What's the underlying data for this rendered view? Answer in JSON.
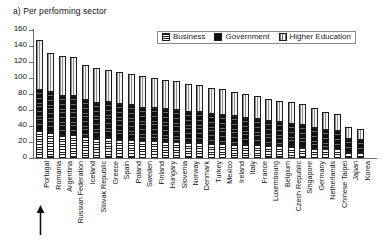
{
  "chart_title": "a) Per performing sector",
  "legend": {
    "position": "top-center",
    "items": [
      {
        "label": "Business",
        "pattern": "horizontal-hatch"
      },
      {
        "label": "Government",
        "pattern": "solid-black"
      },
      {
        "label": "Higher Education",
        "pattern": "vertical-hatch"
      }
    ]
  },
  "annotation": {
    "arrow_icon": "up-arrow",
    "points_at": "Portugal"
  },
  "chart_data": {
    "type": "bar",
    "stacked": true,
    "title": "a) Per performing sector",
    "xlabel": "",
    "ylabel": "",
    "ylim": [
      0,
      160
    ],
    "ytick_step": 20,
    "yticks": [
      0,
      20,
      40,
      60,
      80,
      100,
      120,
      140,
      160
    ],
    "grid": false,
    "legend_entries": [
      "Business",
      "Government",
      "Higher Education"
    ],
    "categories": [
      "Portugal",
      "Romania",
      "Argentina",
      "Russian Federation",
      "Iceland",
      "Slovak Republic",
      "Greece",
      "Spain",
      "Poland",
      "Sweden",
      "Finland",
      "Hungary",
      "Slovenia",
      "Norway",
      "Denmark",
      "Turkey",
      "Mexico",
      "Ireland",
      "Italy",
      "France",
      "Luxembourg",
      "Belgium",
      "Czech Republic",
      "Singapore",
      "Germany",
      "Netherlands",
      "Chinese Taipei",
      "Japan",
      "Korea"
    ],
    "series": [
      {
        "name": "Business",
        "pattern": "horizontal-hatch",
        "values": [
          35,
          33,
          29,
          30,
          27,
          25,
          26,
          24,
          24,
          22,
          22,
          21,
          21,
          20,
          20,
          19,
          19,
          18,
          17,
          17,
          16,
          16,
          15,
          14,
          13,
          12,
          12,
          8,
          7
        ]
      },
      {
        "name": "Government",
        "pattern": "solid-black",
        "values": [
          50,
          50,
          49,
          48,
          46,
          44,
          44,
          43,
          42,
          41,
          41,
          40,
          39,
          38,
          37,
          36,
          35,
          34,
          33,
          32,
          30,
          29,
          28,
          27,
          25,
          23,
          22,
          16,
          15
        ]
      },
      {
        "name": "Higher Education",
        "pattern": "vertical-hatch",
        "values": [
          63,
          48,
          50,
          48,
          43,
          44,
          40,
          41,
          39,
          39,
          37,
          37,
          36,
          35,
          34,
          33,
          32,
          31,
          30,
          29,
          28,
          26,
          27,
          26,
          24,
          22,
          21,
          15,
          14
        ]
      }
    ],
    "totals": [
      148,
      131,
      128,
      126,
      116,
      113,
      110,
      108,
      105,
      102,
      100,
      98,
      96,
      93,
      91,
      88,
      86,
      83,
      80,
      78,
      74,
      71,
      70,
      67,
      62,
      57,
      55,
      39,
      36
    ]
  }
}
